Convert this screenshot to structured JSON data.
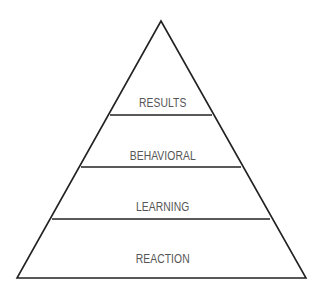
{
  "diagram": {
    "type": "pyramid",
    "colors": {
      "line": "#222222",
      "text": "#555555",
      "background": "#ffffff"
    },
    "levels": [
      {
        "label": "RESULTS",
        "position": "top"
      },
      {
        "label": "BEHAVIORAL",
        "position": "second"
      },
      {
        "label": "LEARNING",
        "position": "third"
      },
      {
        "label": "REACTION",
        "position": "bottom"
      }
    ]
  }
}
